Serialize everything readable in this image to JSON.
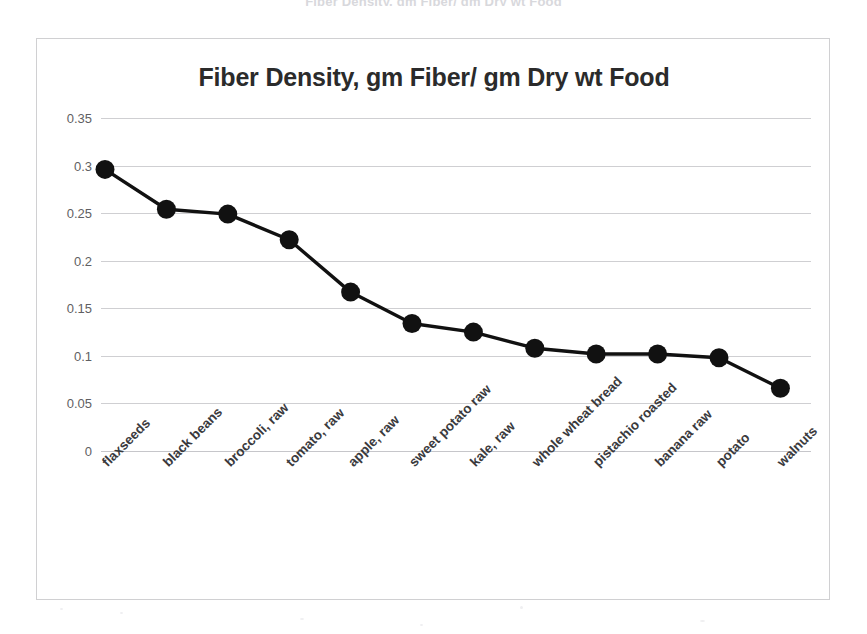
{
  "scan": {
    "top_cropped_text": "Fiber Density, gm Fiber/ gm Dry wt Food"
  },
  "chart_data": {
    "type": "line",
    "title": "Fiber Density, gm Fiber/ gm Dry wt Food",
    "xlabel": "",
    "ylabel": "",
    "ylim": [
      0,
      0.35
    ],
    "ytick_labels": [
      "0.35",
      "0.3",
      "0.25",
      "0.2",
      "0.15",
      "0.1",
      "0.05",
      "0"
    ],
    "yticks": [
      0.35,
      0.3,
      0.25,
      0.2,
      0.15,
      0.1,
      0.05,
      0
    ],
    "grid": true,
    "legend": "none",
    "marker": "circle",
    "marker_color": "#111111",
    "line_color": "#111111",
    "categories": [
      "flaxseeds",
      "black beans",
      "broccoli, raw",
      "tomato, raw",
      "apple, raw",
      "sweet potato raw",
      "kale, raw",
      "whole wheat bread",
      "pistachio roasted",
      "banana raw",
      "potato",
      "walnuts"
    ],
    "values": [
      0.296,
      0.254,
      0.249,
      0.222,
      0.167,
      0.134,
      0.125,
      0.108,
      0.102,
      0.102,
      0.098,
      0.066
    ]
  },
  "colors": {
    "series": "#111111",
    "gridline": "#cfcfd2",
    "frame": "#d0d0d2",
    "title": "#2b2b2b",
    "tick_text": "#5f5f63",
    "background": "#ffffff"
  }
}
